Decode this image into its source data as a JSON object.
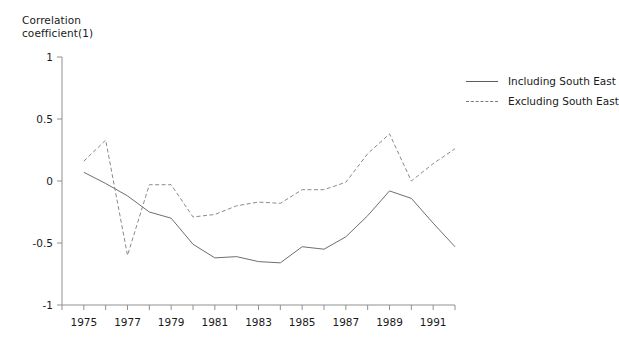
{
  "chart_data": {
    "type": "line",
    "title": "",
    "ylabel": "Correlation\ncoefficient(1)",
    "xlabel": "",
    "ylim": [
      -1,
      1
    ],
    "xlim": [
      1974,
      1992
    ],
    "grid": false,
    "legend_position": "top-right",
    "yticks": [
      1,
      0.5,
      0,
      -0.5,
      -1
    ],
    "ytick_labels": [
      "1",
      "0.5",
      "0",
      "-0.5",
      "-1"
    ],
    "xticks": [
      1974,
      1975,
      1976,
      1977,
      1978,
      1979,
      1980,
      1981,
      1982,
      1983,
      1984,
      1985,
      1986,
      1987,
      1988,
      1989,
      1990,
      1991,
      1992
    ],
    "xtick_labels": [
      "",
      "1975",
      "",
      "1977",
      "",
      "1979",
      "",
      "1981",
      "",
      "1983",
      "",
      "1985",
      "",
      "1987",
      "",
      "1989",
      "",
      "1991",
      ""
    ],
    "x": [
      1975,
      1976,
      1977,
      1978,
      1979,
      1980,
      1981,
      1982,
      1983,
      1984,
      1985,
      1986,
      1987,
      1988,
      1989,
      1990,
      1991,
      1992
    ],
    "series": [
      {
        "name": "Including South East",
        "style": "solid",
        "color": "#6e6e6e",
        "values": [
          0.07,
          -0.02,
          -0.12,
          -0.25,
          -0.3,
          -0.51,
          -0.62,
          -0.61,
          -0.65,
          -0.66,
          -0.53,
          -0.55,
          -0.45,
          -0.28,
          -0.08,
          -0.14,
          -0.34,
          -0.53
        ]
      },
      {
        "name": "Excluding South East",
        "style": "dashed",
        "color": "#8a8a8a",
        "values": [
          0.16,
          0.33,
          -0.6,
          -0.03,
          -0.03,
          -0.29,
          -0.27,
          -0.2,
          -0.17,
          -0.18,
          -0.07,
          -0.07,
          -0.01,
          0.22,
          0.38,
          0.0,
          0.14,
          0.26
        ]
      }
    ]
  },
  "legend": {
    "items": [
      {
        "label": "Including South East",
        "style": "solid"
      },
      {
        "label": "Excluding South East",
        "style": "dashed"
      }
    ]
  }
}
